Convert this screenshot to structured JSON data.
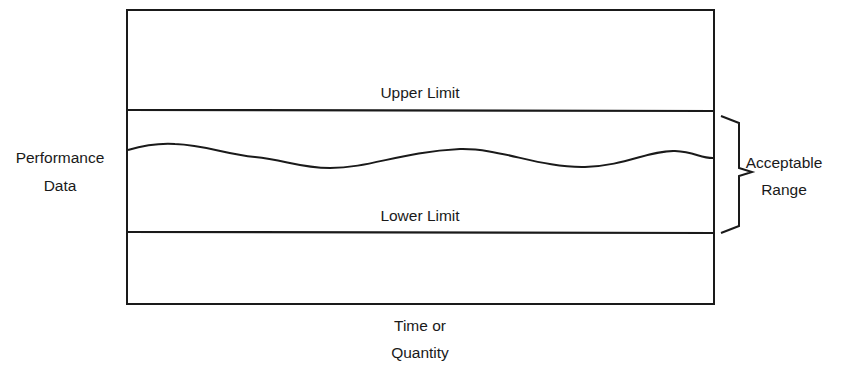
{
  "diagram": {
    "type": "control-limits-diagram",
    "colors": {
      "line": "#1a1a1a",
      "background": "#ffffff"
    },
    "labels": {
      "upper_limit": "Upper Limit",
      "lower_limit": "Lower Limit",
      "y_axis_line1": "Performance",
      "y_axis_line2": "Data",
      "x_axis_line1": "Time or",
      "x_axis_line2": "Quantity",
      "range_line1": "Acceptable",
      "range_line2": "Range"
    },
    "elements": [
      "outer-frame",
      "upper-limit-line",
      "lower-limit-line",
      "performance-curve",
      "acceptable-range-brace"
    ]
  }
}
